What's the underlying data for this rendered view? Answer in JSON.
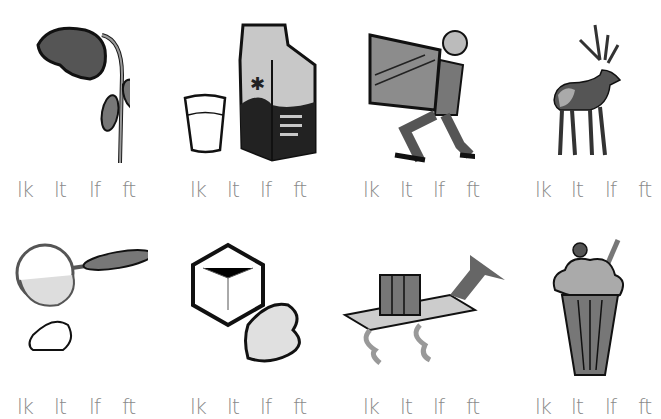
{
  "worksheet": {
    "items": [
      {
        "picture": "wilted-flower",
        "choices": [
          "lk",
          "lt",
          "lf",
          "ft"
        ]
      },
      {
        "picture": "milk-carton-and-glass",
        "choices": [
          "lk",
          "lt",
          "lf",
          "ft"
        ]
      },
      {
        "picture": "man-lifting-box",
        "choices": [
          "lk",
          "lt",
          "lf",
          "ft"
        ]
      },
      {
        "picture": "elk",
        "choices": [
          "lk",
          "lt",
          "lf",
          "ft"
        ]
      },
      {
        "picture": "sifter-with-flour",
        "choices": [
          "lk",
          "lt",
          "lf",
          "ft"
        ]
      },
      {
        "picture": "melting-ice-cube",
        "choices": [
          "lk",
          "lt",
          "lf",
          "ft"
        ]
      },
      {
        "picture": "shelf-with-books",
        "choices": [
          "lk",
          "lt",
          "lf",
          "ft"
        ]
      },
      {
        "picture": "malt-milkshake",
        "choices": [
          "lk",
          "lt",
          "lf",
          "ft"
        ]
      }
    ]
  },
  "colors": {
    "letters": "#8a8a8a",
    "ink": "#1c1c1c",
    "gray": "#8c8c8c",
    "lightgray": "#cfcfcf"
  }
}
